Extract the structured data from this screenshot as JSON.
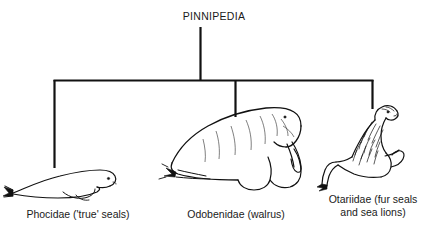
{
  "diagram": {
    "type": "taxonomy-tree",
    "root": {
      "label": "PINNIPEDIA"
    },
    "branches": [
      {
        "id": "phocidae",
        "label": "Phocidae ('true' seals)",
        "illustration": "harbor-seal-lying-profile"
      },
      {
        "id": "odobenidae",
        "label": "Odobenidae (walrus)",
        "illustration": "walrus-with-tusks-profile"
      },
      {
        "id": "otariidae",
        "label": "Otariidae (fur seals\nand sea lions)",
        "illustration": "sea-lion-upright-profile"
      }
    ],
    "colors": {
      "ink": "#111111",
      "background": "#ffffff"
    }
  }
}
